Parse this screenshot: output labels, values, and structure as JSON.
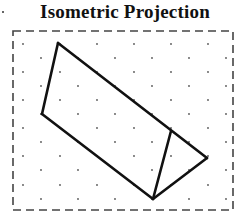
{
  "title": "Isometric Projection",
  "frame": {
    "x1": 13,
    "y1": 31,
    "x2": 233,
    "y2": 210,
    "stroke": "#444444",
    "dash": "8,5"
  },
  "dot_grid": {
    "rows_y": [
      44,
      58,
      72,
      86,
      100,
      114,
      128,
      142,
      156,
      170,
      185,
      199
    ],
    "cols_a_x": [
      23,
      60,
      97,
      134,
      171,
      208
    ],
    "cols_b_x": [
      41,
      78,
      115,
      152,
      189,
      226
    ],
    "color": "#555555"
  },
  "shape": {
    "stroke": "#111111",
    "vertices": {
      "top": [
        58,
        43
      ],
      "left": [
        42,
        114
      ],
      "inner": [
        171,
        131
      ],
      "right": [
        207,
        158
      ],
      "bottom": [
        153,
        199
      ]
    },
    "edges": [
      [
        "top",
        "left"
      ],
      [
        "top",
        "right"
      ],
      [
        "left",
        "bottom"
      ],
      [
        "right",
        "bottom"
      ],
      [
        "inner",
        "bottom"
      ]
    ]
  }
}
